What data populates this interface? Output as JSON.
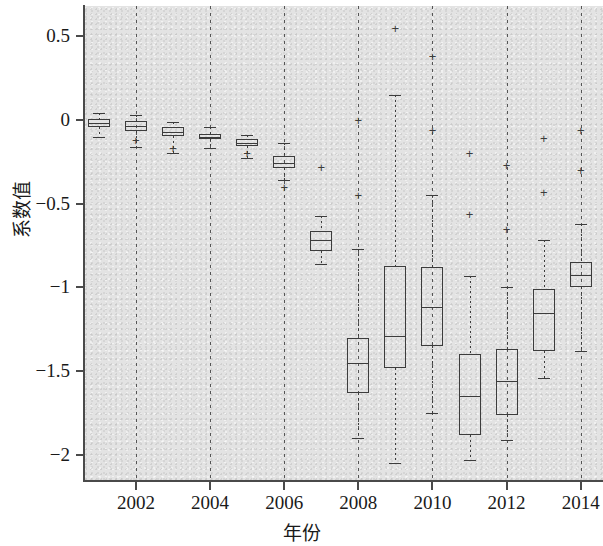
{
  "chart_data": {
    "type": "box",
    "title": "",
    "xlabel": "年份",
    "ylabel": "系数值",
    "xlim": [
      2000.6,
      2014.6
    ],
    "ylim": [
      -2.15,
      0.68
    ],
    "yticks": [
      0.5,
      0,
      -0.5,
      -1,
      -1.5,
      -2
    ],
    "ytick_labels": [
      "0.5",
      "0",
      "−0.5",
      "−1",
      "−1.5",
      "−2"
    ],
    "xticks": [
      2002,
      2004,
      2006,
      2008,
      2010,
      2012,
      2014
    ],
    "xtick_labels": [
      "2002",
      "2004",
      "2006",
      "2008",
      "2010",
      "2012",
      "2014"
    ],
    "gridlines_x": [
      2002,
      2004,
      2006,
      2008,
      2010,
      2012,
      2014
    ],
    "grid": "vertical dashed",
    "plot_background": "#e3e3e3",
    "line_color": "#3c3c3c",
    "axis_color": "#4a4a4a",
    "boxes": [
      {
        "year": 2001,
        "whisker_low": -0.1,
        "q1": -0.045,
        "median": -0.02,
        "q3": 0.005,
        "whisker_high": 0.04,
        "outliers": []
      },
      {
        "year": 2002,
        "whisker_low": -0.16,
        "q1": -0.065,
        "median": -0.035,
        "q3": -0.005,
        "whisker_high": 0.03,
        "outliers": [
          -0.12
        ]
      },
      {
        "year": 2003,
        "whisker_low": -0.2,
        "q1": -0.095,
        "median": -0.07,
        "q3": -0.045,
        "whisker_high": -0.01,
        "outliers": [
          -0.17
        ]
      },
      {
        "year": 2004,
        "whisker_low": -0.17,
        "q1": -0.115,
        "median": -0.1,
        "q3": -0.085,
        "whisker_high": -0.04,
        "outliers": []
      },
      {
        "year": 2005,
        "whisker_low": -0.23,
        "q1": -0.155,
        "median": -0.135,
        "q3": -0.115,
        "whisker_high": -0.09,
        "outliers": [
          -0.2
        ]
      },
      {
        "year": 2006,
        "whisker_low": -0.36,
        "q1": -0.285,
        "median": -0.255,
        "q3": -0.215,
        "whisker_high": -0.14,
        "outliers": [
          -0.4
        ]
      },
      {
        "year": 2007,
        "whisker_low": -0.86,
        "q1": -0.78,
        "median": -0.72,
        "q3": -0.665,
        "whisker_high": -0.575,
        "outliers": [
          -0.28
        ]
      },
      {
        "year": 2008,
        "whisker_low": -1.9,
        "q1": -1.63,
        "median": -1.45,
        "q3": -1.3,
        "whisker_high": -0.77,
        "outliers": [
          0.0,
          -0.45
        ]
      },
      {
        "year": 2009,
        "whisker_low": -2.05,
        "q1": -1.48,
        "median": -1.29,
        "q3": -0.875,
        "whisker_high": 0.15,
        "outliers": [
          0.55
        ]
      },
      {
        "year": 2010,
        "whisker_low": -1.75,
        "q1": -1.35,
        "median": -1.12,
        "q3": -0.88,
        "whisker_high": -0.45,
        "outliers": [
          0.38,
          -0.06
        ]
      },
      {
        "year": 2011,
        "whisker_low": -2.03,
        "q1": -1.88,
        "median": -1.65,
        "q3": -1.4,
        "whisker_high": -0.93,
        "outliers": [
          -0.2,
          -0.56
        ]
      },
      {
        "year": 2012,
        "whisker_low": -1.91,
        "q1": -1.76,
        "median": -1.56,
        "q3": -1.37,
        "whisker_high": -1.0,
        "outliers": [
          -0.27,
          -0.65
        ]
      },
      {
        "year": 2013,
        "whisker_low": -1.54,
        "q1": -1.38,
        "median": -1.15,
        "q3": -1.01,
        "whisker_high": -0.72,
        "outliers": [
          -0.11,
          -0.43
        ]
      },
      {
        "year": 2014,
        "whisker_low": -1.38,
        "q1": -1.0,
        "median": -0.925,
        "q3": -0.85,
        "whisker_high": -0.62,
        "outliers": [
          -0.06,
          -0.3
        ]
      }
    ]
  }
}
